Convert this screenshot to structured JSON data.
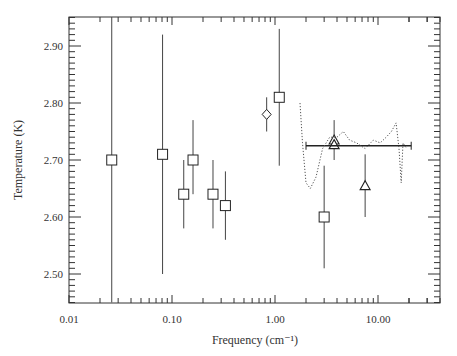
{
  "chart_data": {
    "type": "scatter",
    "title": "",
    "xlabel": "Frequency (cm⁻¹)",
    "ylabel": "Temperature (K)",
    "xscale": "log",
    "xlim": [
      0.01,
      40
    ],
    "ylim": [
      2.45,
      2.97
    ],
    "x_ticks": [
      "0.01",
      "0.10",
      "1.00",
      "10.00"
    ],
    "y_ticks": [
      "2.50",
      "2.60",
      "2.70",
      "2.80",
      "2.90"
    ],
    "grid": false,
    "legend": null,
    "series": [
      {
        "name": "squares",
        "marker": "square",
        "points": [
          {
            "x": 0.026,
            "y": 2.7,
            "ylo": 2.45,
            "yhi": 2.97
          },
          {
            "x": 0.081,
            "y": 2.71,
            "ylo": 2.5,
            "yhi": 2.92
          },
          {
            "x": 0.13,
            "y": 2.64,
            "ylo": 2.58,
            "yhi": 2.7
          },
          {
            "x": 0.16,
            "y": 2.7,
            "ylo": 2.64,
            "yhi": 2.77
          },
          {
            "x": 0.25,
            "y": 2.64,
            "ylo": 2.58,
            "yhi": 2.7
          },
          {
            "x": 0.33,
            "y": 2.62,
            "ylo": 2.56,
            "yhi": 2.68
          },
          {
            "x": 1.1,
            "y": 2.81,
            "ylo": 2.69,
            "yhi": 2.93
          },
          {
            "x": 3.0,
            "y": 2.6,
            "ylo": 2.51,
            "yhi": 2.69
          }
        ]
      },
      {
        "name": "diamond",
        "marker": "diamond",
        "points": [
          {
            "x": 0.83,
            "y": 2.78,
            "ylo": 2.75,
            "yhi": 2.81
          }
        ]
      },
      {
        "name": "triangles",
        "marker": "triangle",
        "points": [
          {
            "x": 3.75,
            "y": 2.735,
            "ylo": 2.7,
            "yhi": 2.77
          },
          {
            "x": 3.75,
            "y": 2.727,
            "ylo": 2.72,
            "yhi": 2.73
          },
          {
            "x": 7.5,
            "y": 2.655,
            "ylo": 2.6,
            "yhi": 2.71
          }
        ]
      },
      {
        "name": "horizontal-band",
        "marker": "hbar",
        "points": [
          {
            "x": 3.75,
            "y": 2.725,
            "xlo": 2.0,
            "xhi": 21.0
          }
        ]
      },
      {
        "name": "dotted-spectrum",
        "marker": "dotted-line",
        "points": [
          {
            "x": 1.75,
            "y": 2.8
          },
          {
            "x": 1.85,
            "y": 2.73
          },
          {
            "x": 2.0,
            "y": 2.66
          },
          {
            "x": 2.2,
            "y": 2.65
          },
          {
            "x": 2.5,
            "y": 2.67
          },
          {
            "x": 2.9,
            "y": 2.72
          },
          {
            "x": 3.4,
            "y": 2.74
          },
          {
            "x": 4.0,
            "y": 2.74
          },
          {
            "x": 4.6,
            "y": 2.75
          },
          {
            "x": 5.3,
            "y": 2.735
          },
          {
            "x": 6.2,
            "y": 2.73
          },
          {
            "x": 7.5,
            "y": 2.72
          },
          {
            "x": 9.0,
            "y": 2.735
          },
          {
            "x": 10.5,
            "y": 2.73
          },
          {
            "x": 12.0,
            "y": 2.74
          },
          {
            "x": 13.5,
            "y": 2.75
          },
          {
            "x": 15.0,
            "y": 2.765
          },
          {
            "x": 16.0,
            "y": 2.72
          },
          {
            "x": 16.8,
            "y": 2.66
          },
          {
            "x": 17.5,
            "y": 2.73
          },
          {
            "x": 19.0,
            "y": 2.72
          }
        ]
      }
    ]
  }
}
